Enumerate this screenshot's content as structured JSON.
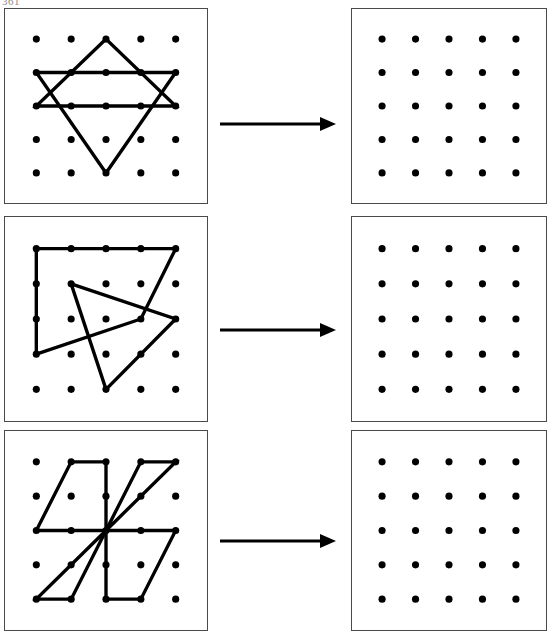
{
  "page": {
    "corner_label": "361",
    "background": "#ffffff",
    "ink": "#000000",
    "panel_border": "#4a4a4a"
  },
  "grid": {
    "columns": 5,
    "rows": 5,
    "dot_radius": 3.6,
    "dot_color": "#000000",
    "description": "5 by 5 square array of dots"
  },
  "arrow": {
    "name": "right-arrow",
    "color": "#000000",
    "direction": "right",
    "count": 3
  },
  "rows": [
    {
      "id": "row-1",
      "top": 8,
      "height": 196,
      "arrow_top": 104,
      "left_panel": {
        "name": "figure-panel-star-of-david",
        "label": "hexagram on 5x5 dot grid",
        "shapes": [
          {
            "name": "triangle-up",
            "type": "polygon",
            "points": [
              [
                2,
                0
              ],
              [
                0,
                2
              ],
              [
                4,
                2
              ]
            ]
          },
          {
            "name": "triangle-down",
            "type": "polygon",
            "points": [
              [
                0,
                1
              ],
              [
                4,
                1
              ],
              [
                2,
                4
              ]
            ]
          }
        ]
      },
      "right_panel": {
        "name": "answer-panel-blank-grid-1",
        "label": "empty 5x5 dot grid",
        "shapes": []
      }
    },
    {
      "id": "row-2",
      "top": 216,
      "height": 206,
      "arrow_top": 318,
      "left_panel": {
        "name": "figure-panel-quadrilateral-and-triangle",
        "label": "quadrilateral overlapping a triangle on 5x5 dot grid",
        "shapes": [
          {
            "name": "quadrilateral",
            "type": "polygon",
            "points": [
              [
                0,
                0
              ],
              [
                4,
                0
              ],
              [
                3,
                2
              ],
              [
                0,
                3
              ]
            ]
          },
          {
            "name": "triangle",
            "type": "polygon",
            "points": [
              [
                1,
                1
              ],
              [
                4,
                2
              ],
              [
                2,
                4
              ]
            ]
          }
        ]
      },
      "right_panel": {
        "name": "answer-panel-blank-grid-2",
        "label": "empty 5x5 dot grid",
        "shapes": []
      }
    },
    {
      "id": "row-3",
      "top": 430,
      "height": 201,
      "arrow_top": 529,
      "left_panel": {
        "name": "figure-panel-pinwheel",
        "label": "pinwheel of four parallelograms around centre dot on 5x5 dot grid",
        "shapes": [
          {
            "name": "pinwheel-blade-top-left",
            "type": "polygon",
            "points": [
              [
                1,
                0
              ],
              [
                2,
                0
              ],
              [
                2,
                2
              ],
              [
                0,
                2
              ]
            ]
          },
          {
            "name": "pinwheel-blade-top-right",
            "type": "polygon",
            "points": [
              [
                3,
                0
              ],
              [
                4,
                0
              ],
              [
                2,
                2
              ]
            ]
          },
          {
            "name": "pinwheel-blade-bottom-right",
            "type": "polygon",
            "points": [
              [
                2,
                2
              ],
              [
                4,
                2
              ],
              [
                3,
                4
              ],
              [
                2,
                4
              ]
            ]
          },
          {
            "name": "pinwheel-blade-bottom-left",
            "type": "polygon",
            "points": [
              [
                2,
                2
              ],
              [
                1,
                4
              ],
              [
                0,
                4
              ]
            ]
          }
        ]
      },
      "right_panel": {
        "name": "answer-panel-blank-grid-3",
        "label": "empty 5x5 dot grid",
        "shapes": []
      }
    }
  ]
}
